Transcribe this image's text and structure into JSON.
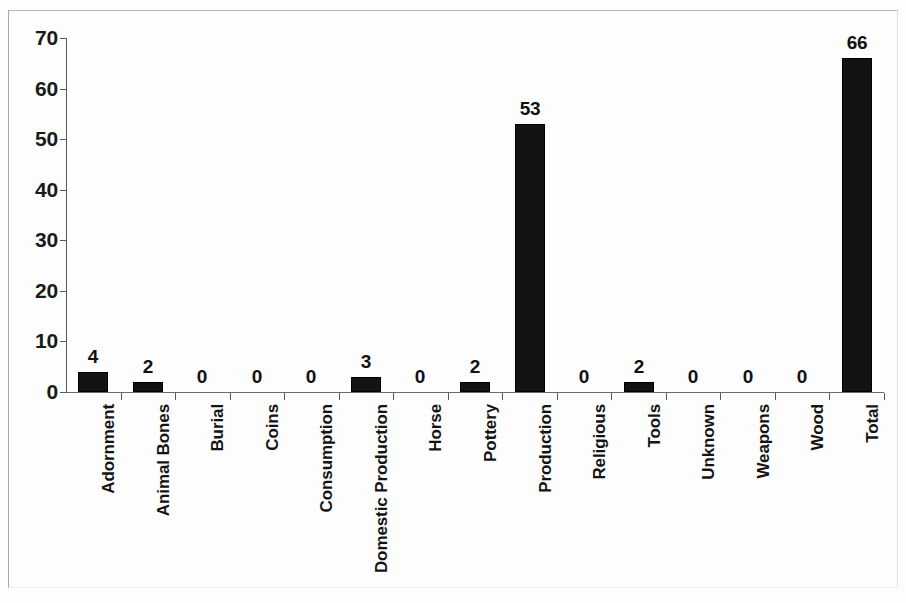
{
  "chart_data": {
    "type": "bar",
    "title": "",
    "subtitle": "",
    "xlabel": "",
    "ylabel": "",
    "ylim": [
      0,
      70
    ],
    "y_ticks": [
      0,
      10,
      20,
      30,
      40,
      50,
      60,
      70
    ],
    "grid": false,
    "legend": null,
    "bar_color": "#131313",
    "text_color": "#111111",
    "axis_color": "#5a5a5a",
    "frame_color": "#b9b9b9",
    "categories": [
      "Adornment",
      "Animal Bones",
      "Burial",
      "Coins",
      "Consumption",
      "Domestic Production",
      "Horse",
      "Pottery",
      "Production",
      "Religious",
      "Tools",
      "Unknown",
      "Weapons",
      "Wood",
      "Total"
    ],
    "values": [
      4,
      2,
      0,
      0,
      0,
      3,
      0,
      2,
      53,
      0,
      2,
      0,
      0,
      0,
      66
    ],
    "value_labels": [
      "4",
      "2",
      "0",
      "0",
      "0",
      "3",
      "0",
      "2",
      "53",
      "0",
      "2",
      "0",
      "0",
      "0",
      "66"
    ],
    "y_tick_labels": [
      "0",
      "10",
      "20",
      "30",
      "40",
      "50",
      "60",
      "70"
    ]
  }
}
